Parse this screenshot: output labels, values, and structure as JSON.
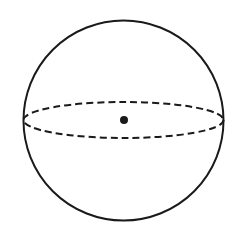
{
  "diagram": {
    "type": "sphere",
    "background": "#ffffff",
    "stroke_color": "#1a1a1a",
    "outline": {
      "cx": 123.5,
      "cy": 120.5,
      "r": 100,
      "stroke_width": 2
    },
    "equator": {
      "cx": 123.5,
      "cy": 120,
      "rx": 100,
      "ry": 18,
      "stroke_width": 2,
      "dasharray": "7 4",
      "style": "dashed"
    },
    "center_point": {
      "cx": 124,
      "cy": 120,
      "r": 4
    }
  }
}
